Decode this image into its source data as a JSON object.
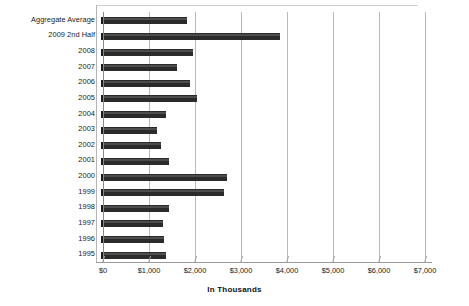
{
  "chart_data": {
    "type": "bar",
    "orientation": "horizontal",
    "title": "",
    "xlabel": "In Thousands",
    "ylabel": "",
    "xlim": [
      0,
      7000
    ],
    "xticks": [
      0,
      1000,
      2000,
      3000,
      4000,
      5000,
      6000,
      7000
    ],
    "xtick_labels": [
      "$0",
      "$1,000",
      "$2,000",
      "$3,000",
      "$4,000",
      "$5,000",
      "$6,000",
      "$7,000"
    ],
    "grid": true,
    "legend": false,
    "bar_color": "#2b2b2b",
    "categories": [
      "Aggregate Average",
      "2009 2nd Half",
      "2008",
      "2007",
      "2006",
      "2005",
      "2004",
      "2003",
      "2002",
      "2001",
      "2000",
      "1999",
      "1998",
      "1997",
      "1996",
      "1995"
    ],
    "values": [
      2950,
      6200,
      3150,
      2600,
      3050,
      3300,
      2200,
      1900,
      2050,
      2300,
      4350,
      4250,
      2300,
      2100,
      2150,
      2200
    ]
  }
}
